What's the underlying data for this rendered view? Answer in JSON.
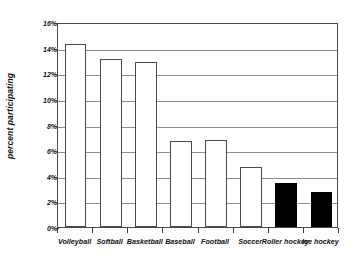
{
  "chart_data": {
    "type": "bar",
    "title": "",
    "xlabel": "",
    "ylabel": "percent participating",
    "ylim": [
      0,
      16
    ],
    "ytick_labels": [
      "0%",
      "2%",
      "4%",
      "6%",
      "8%",
      "10%",
      "12%",
      "14%",
      "16%"
    ],
    "ytick_values": [
      0,
      2,
      4,
      6,
      8,
      10,
      12,
      14,
      16
    ],
    "grid": true,
    "legend": null,
    "categories": [
      "Volleyball",
      "Softball",
      "Basketball",
      "Baseball",
      "Football",
      "Soccer",
      "Roller hockey",
      "Ice hockey"
    ],
    "values": [
      14.3,
      13.1,
      12.9,
      6.7,
      6.8,
      4.7,
      3.4,
      2.7
    ],
    "bar_colors": [
      "#ffffff",
      "#ffffff",
      "#ffffff",
      "#ffffff",
      "#ffffff",
      "#ffffff",
      "#000000",
      "#000000"
    ],
    "bar_edge_color": "#4a4a4a",
    "gridline_color": "#8d8d8d",
    "axis_color": "#3a3a3a",
    "background_color": "#ffffff"
  }
}
